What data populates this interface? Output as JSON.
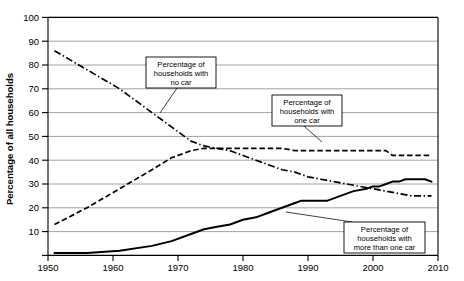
{
  "chart_data": {
    "type": "line",
    "title": "",
    "xlabel": "",
    "ylabel": "Percentage of all households",
    "xlim": [
      1950,
      2010
    ],
    "ylim": [
      0,
      100
    ],
    "grid": true,
    "legend_position": "annotations-inline",
    "xticks": [
      "1950",
      "1960",
      "1970",
      "1980",
      "1990",
      "2000",
      "2010"
    ],
    "xtick_values": [
      1950,
      1960,
      1970,
      1980,
      1990,
      2000,
      2010
    ],
    "yticks": [
      "100",
      "90",
      "80",
      "70",
      "60",
      "50",
      "40",
      "30",
      "20",
      "10"
    ],
    "ytick_values": [
      100,
      90,
      80,
      70,
      60,
      50,
      40,
      30,
      20,
      10
    ],
    "series": [
      {
        "name": "Percentage of households with no car",
        "style": "dash-dot",
        "x": [
          1951,
          1956,
          1961,
          1966,
          1969,
          1972,
          1974,
          1976,
          1978,
          1980,
          1982,
          1984,
          1986,
          1988,
          1990,
          1992,
          1994,
          1996,
          1998,
          2000,
          2002,
          2004,
          2006,
          2008,
          2009
        ],
        "values": [
          86,
          78,
          70,
          60,
          54,
          48,
          46,
          45,
          44,
          42,
          40,
          38,
          36,
          35,
          33,
          32,
          31,
          30,
          29,
          28,
          27,
          26,
          25,
          25,
          25
        ]
      },
      {
        "name": "Percentage of households with one car",
        "style": "dashed",
        "x": [
          1951,
          1956,
          1961,
          1966,
          1969,
          1972,
          1974,
          1976,
          1978,
          1980,
          1982,
          1984,
          1986,
          1988,
          1990,
          1992,
          1994,
          1996,
          1998,
          2000,
          2002,
          2003,
          2004,
          2006,
          2008,
          2009
        ],
        "values": [
          13,
          20,
          28,
          36,
          41,
          44,
          45,
          45,
          45,
          45,
          45,
          45,
          45,
          44,
          44,
          44,
          44,
          44,
          44,
          44,
          44,
          42,
          42,
          42,
          42,
          42
        ]
      },
      {
        "name": "Percentage of households with more than one car",
        "style": "solid",
        "x": [
          1951,
          1956,
          1961,
          1966,
          1969,
          1972,
          1974,
          1976,
          1978,
          1980,
          1982,
          1984,
          1986,
          1988,
          1989,
          1991,
          1993,
          1995,
          1997,
          1999,
          2000,
          2001,
          2002,
          2003,
          2004,
          2005,
          2006,
          2008,
          2009
        ],
        "values": [
          1,
          1,
          2,
          4,
          6,
          9,
          11,
          12,
          13,
          15,
          16,
          18,
          20,
          22,
          23,
          23,
          23,
          25,
          27,
          28,
          29,
          29,
          30,
          31,
          31,
          32,
          32,
          32,
          31
        ]
      }
    ],
    "annotations": [
      {
        "id": "anno-no-car",
        "lines": [
          "Percentage of",
          "households with",
          "no car"
        ]
      },
      {
        "id": "anno-one-car",
        "lines": [
          "Percentage of",
          "households with",
          "one car"
        ]
      },
      {
        "id": "anno-multi-car",
        "lines": [
          "Percentage of",
          "households with",
          "more than one car"
        ]
      }
    ]
  }
}
